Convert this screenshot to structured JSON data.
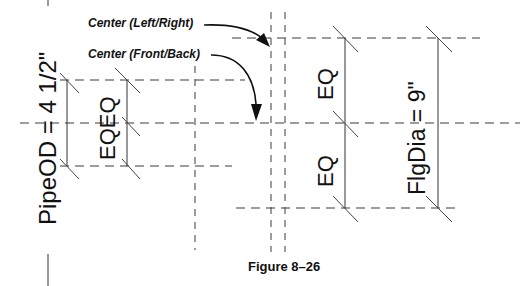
{
  "figure": {
    "caption": "Figure 8–26",
    "callouts": [
      {
        "id": "center-left-right",
        "label": "Center (Left/Right)"
      },
      {
        "id": "center-front-back",
        "label": "Center (Front/Back)"
      }
    ],
    "dimensions": {
      "pipe_od": "PipeOD = 4 1/2\"",
      "inner_eq": "EQEQ",
      "right_eq_upper": "EQ",
      "right_eq_lower": "EQ",
      "flange_dia": "FlgDia = 9\""
    },
    "colors": {
      "line": "#333333",
      "text": "#111111",
      "background": "#ffffff"
    }
  }
}
